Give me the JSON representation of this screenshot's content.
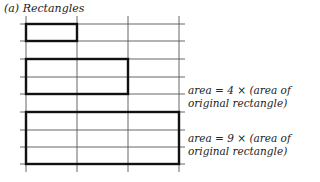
{
  "title": "(a) Rectangles",
  "captions": [
    {
      "line1": "area = 4 × (area of",
      "line2": "original rectangle)"
    },
    {
      "line1": "area = 9 × (area of",
      "line2": "original rectangle)"
    }
  ],
  "grid": {
    "vertical_x": [
      26,
      77,
      128,
      179
    ],
    "horizontal_y": [
      24,
      41,
      59,
      77,
      94,
      112,
      130,
      147,
      164
    ]
  },
  "rectangles": [
    {
      "name": "original",
      "x1": 26,
      "y1": 24,
      "x2": 77,
      "y2": 41
    },
    {
      "name": "scaled-2x",
      "x1": 26,
      "y1": 59,
      "x2": 128,
      "y2": 94
    },
    {
      "name": "scaled-3x",
      "x1": 26,
      "y1": 112,
      "x2": 179,
      "y2": 164
    }
  ]
}
